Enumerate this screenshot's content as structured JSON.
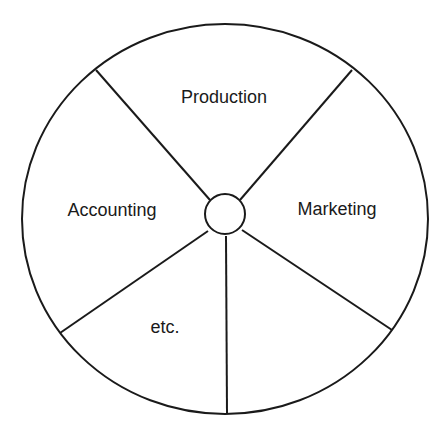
{
  "diagram": {
    "type": "wheel",
    "hub": "",
    "segments": [
      {
        "label": "Production"
      },
      {
        "label": "Marketing"
      },
      {
        "label": ""
      },
      {
        "label": "etc."
      },
      {
        "label": "Accounting"
      }
    ]
  }
}
